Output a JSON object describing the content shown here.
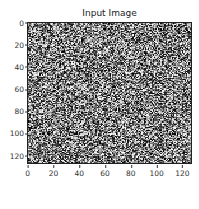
{
  "chart_data": {
    "type": "heatmap",
    "title": "Input Image",
    "xlabel": "",
    "ylabel": "",
    "colormap": "gray",
    "image_size": [
      128,
      128
    ],
    "xlim": [
      0,
      127
    ],
    "ylim": [
      127,
      0
    ],
    "xticks": [
      0,
      20,
      40,
      60,
      80,
      100,
      120
    ],
    "yticks": [
      0,
      20,
      40,
      60,
      80,
      100,
      120
    ],
    "grid": false,
    "legend": null
  },
  "figure": {
    "title": "Input Image",
    "caption": ""
  },
  "axes": {
    "x_tick_labels": [
      "0",
      "20",
      "40",
      "60",
      "80",
      "100",
      "120"
    ],
    "y_tick_labels": [
      "0",
      "20",
      "40",
      "60",
      "80",
      "100",
      "120"
    ]
  }
}
